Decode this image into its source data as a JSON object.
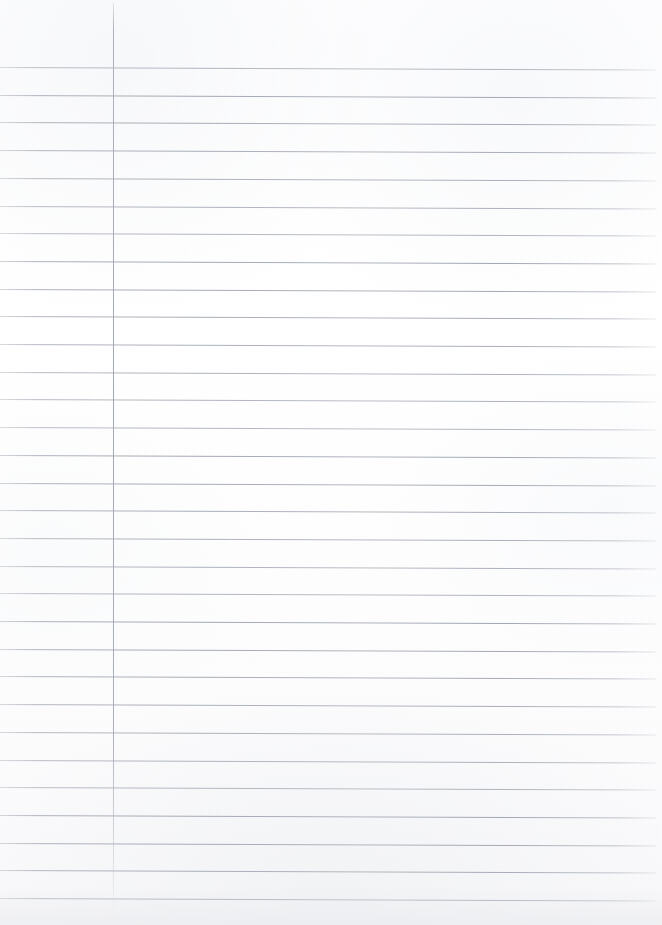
{
  "document": {
    "type": "scanned-ruled-notebook-page",
    "title": "Blank lined notebook page",
    "content_text": "",
    "handwriting_present": "no",
    "printed_text_present": "no"
  },
  "page": {
    "width": 662,
    "height": 925,
    "background_color": "#fefefe",
    "paper_tone": "#ffffff",
    "bottom_edge_tone": "#f2f3f5"
  },
  "ruling": {
    "line_color": "#a6acb7",
    "line_thickness": 1,
    "line_spacing": 27.7,
    "first_line_y": 67,
    "last_line_y": 899,
    "line_count": 31,
    "line_left_x": 0,
    "line_right_x": 656,
    "skew_degrees": 0.22,
    "lines_y": [
      67,
      94.7,
      122.4,
      150.1,
      177.8,
      205.5,
      233.2,
      260.9,
      288.6,
      316.3,
      344,
      371.7,
      399.4,
      427.1,
      454.8,
      482.5,
      510.2,
      537.9,
      565.6,
      593.3,
      621,
      648.7,
      676.4,
      704.1,
      731.8,
      759.5,
      787.2,
      814.9,
      842.6,
      870.3,
      898
    ]
  },
  "margin_rule": {
    "label": "vertical-margin-line",
    "x": 113,
    "top_y": 3,
    "bottom_y": 912,
    "color": "#a6acb7",
    "thickness": 1
  }
}
